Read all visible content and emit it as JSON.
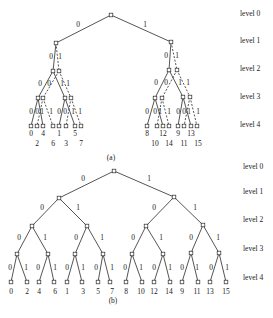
{
  "figure": {
    "level_labels": [
      "level 0",
      "level 1",
      "level 2",
      "level 3",
      "level 4"
    ],
    "node_size": 3.6
  },
  "tree_a": {
    "caption": "(a)",
    "caption_pos": [
      111,
      160
    ],
    "level_label_x": 240,
    "level_label_y": [
      16,
      43,
      71,
      99,
      127
    ],
    "nodes": [
      {
        "id": "r",
        "x": 111,
        "y": 15
      },
      {
        "id": "L",
        "x": 56,
        "y": 43
      },
      {
        "id": "R",
        "x": 171,
        "y": 42
      },
      {
        "id": "L0",
        "x": 53,
        "y": 71
      },
      {
        "id": "L1",
        "x": 59,
        "y": 71
      },
      {
        "id": "R0",
        "x": 169,
        "y": 70
      },
      {
        "id": "R1",
        "x": 177,
        "y": 70
      },
      {
        "id": "a3",
        "x": 38,
        "y": 98
      },
      {
        "id": "b3",
        "x": 43,
        "y": 98
      },
      {
        "id": "c3",
        "x": 65,
        "y": 98
      },
      {
        "id": "d3",
        "x": 71,
        "y": 98
      },
      {
        "id": "e3",
        "x": 155,
        "y": 98
      },
      {
        "id": "f3",
        "x": 162,
        "y": 98
      },
      {
        "id": "g3",
        "x": 183,
        "y": 97
      },
      {
        "id": "h3",
        "x": 190,
        "y": 97
      },
      {
        "id": "n0",
        "x": 31,
        "y": 126
      },
      {
        "id": "n4",
        "x": 37,
        "y": 126
      },
      {
        "id": "n2",
        "x": 43,
        "y": 126
      },
      {
        "id": "n6",
        "x": 53,
        "y": 126
      },
      {
        "id": "n1",
        "x": 59,
        "y": 126
      },
      {
        "id": "n5",
        "x": 66,
        "y": 126
      },
      {
        "id": "n3",
        "x": 75,
        "y": 126
      },
      {
        "id": "n7",
        "x": 81,
        "y": 126
      },
      {
        "id": "n8",
        "x": 147,
        "y": 126
      },
      {
        "id": "n12",
        "x": 157,
        "y": 126
      },
      {
        "id": "n10",
        "x": 163,
        "y": 126
      },
      {
        "id": "n14",
        "x": 169,
        "y": 126
      },
      {
        "id": "n9",
        "x": 178,
        "y": 126
      },
      {
        "id": "n13",
        "x": 184,
        "y": 126
      },
      {
        "id": "n11",
        "x": 191,
        "y": 126
      },
      {
        "id": "n15",
        "x": 197,
        "y": 126
      }
    ],
    "edges": [
      {
        "from": "r",
        "to": "L",
        "style": "solid",
        "label": "0",
        "lx": 78,
        "ly": 27
      },
      {
        "from": "r",
        "to": "R",
        "style": "solid",
        "label": "1",
        "lx": 145,
        "ly": 27
      },
      {
        "from": "L",
        "to": "L0",
        "style": "solid",
        "label": "0",
        "lx": 51,
        "ly": 59
      },
      {
        "from": "L",
        "to": "L1",
        "style": "dashed",
        "label": "1",
        "lx": 60,
        "ly": 59
      },
      {
        "from": "R",
        "to": "R0",
        "style": "solid",
        "label": "0",
        "lx": 166,
        "ly": 58
      },
      {
        "from": "R",
        "to": "R1",
        "style": "dashed",
        "label": "1",
        "lx": 177,
        "ly": 58
      },
      {
        "from": "L0",
        "to": "a3",
        "style": "solid",
        "label": "0",
        "lx": 40,
        "ly": 86
      },
      {
        "from": "L0",
        "to": "c3",
        "style": "solid",
        "label": "1",
        "lx": 62,
        "ly": 86
      },
      {
        "from": "L1",
        "to": "b3",
        "style": "dashed",
        "label": "0",
        "lx": 49,
        "ly": 86
      },
      {
        "from": "L1",
        "to": "d3",
        "style": "dashed",
        "label": "1",
        "lx": 68,
        "ly": 86
      },
      {
        "from": "R0",
        "to": "e3",
        "style": "solid",
        "label": "0",
        "lx": 156,
        "ly": 85
      },
      {
        "from": "R0",
        "to": "g3",
        "style": "solid",
        "label": "1",
        "lx": 180,
        "ly": 85
      },
      {
        "from": "R1",
        "to": "f3",
        "style": "dashed",
        "label": "0",
        "lx": 166,
        "ly": 85
      },
      {
        "from": "R1",
        "to": "h3",
        "style": "dashed",
        "label": "1",
        "lx": 188,
        "ly": 85
      },
      {
        "from": "a3",
        "to": "n0",
        "style": "solid",
        "label": "0",
        "lx": 31,
        "ly": 114
      },
      {
        "from": "a3",
        "to": "n2",
        "style": "solid",
        "label": "1",
        "lx": 42,
        "ly": 114
      },
      {
        "from": "b3",
        "to": "n4",
        "style": "dashed",
        "label": "0",
        "lx": 37,
        "ly": 114
      },
      {
        "from": "b3",
        "to": "n6",
        "style": "dashed",
        "label": "1",
        "lx": 51,
        "ly": 114
      },
      {
        "from": "c3",
        "to": "n1",
        "style": "solid",
        "label": "0",
        "lx": 59,
        "ly": 114
      },
      {
        "from": "c3",
        "to": "n3",
        "style": "solid",
        "label": "1",
        "lx": 73,
        "ly": 114
      },
      {
        "from": "d3",
        "to": "n5",
        "style": "dashed",
        "label": "0",
        "lx": 65,
        "ly": 114
      },
      {
        "from": "d3",
        "to": "n7",
        "style": "dashed",
        "label": "1",
        "lx": 80,
        "ly": 114
      },
      {
        "from": "e3",
        "to": "n8",
        "style": "solid",
        "label": "0",
        "lx": 147,
        "ly": 114
      },
      {
        "from": "e3",
        "to": "n10",
        "style": "solid",
        "label": "1",
        "lx": 160,
        "ly": 114
      },
      {
        "from": "f3",
        "to": "n12",
        "style": "dashed",
        "label": "0",
        "lx": 155,
        "ly": 114
      },
      {
        "from": "f3",
        "to": "n14",
        "style": "dashed",
        "label": "1",
        "lx": 169,
        "ly": 114
      },
      {
        "from": "g3",
        "to": "n9",
        "style": "solid",
        "label": "0",
        "lx": 178,
        "ly": 114
      },
      {
        "from": "g3",
        "to": "n11",
        "style": "solid",
        "label": "1",
        "lx": 189,
        "ly": 114
      },
      {
        "from": "h3",
        "to": "n13",
        "style": "dashed",
        "label": "0",
        "lx": 184,
        "ly": 114
      },
      {
        "from": "h3",
        "to": "n15",
        "style": "dashed",
        "label": "1",
        "lx": 198,
        "ly": 114
      }
    ],
    "leaf_labels": [
      {
        "text": "0",
        "x": 31,
        "y": 136
      },
      {
        "text": "4",
        "x": 43,
        "y": 136
      },
      {
        "text": "1",
        "x": 59,
        "y": 136
      },
      {
        "text": "5",
        "x": 75,
        "y": 136
      },
      {
        "text": "2",
        "x": 37,
        "y": 146
      },
      {
        "text": "6",
        "x": 53,
        "y": 146
      },
      {
        "text": "3",
        "x": 66,
        "y": 146
      },
      {
        "text": "7",
        "x": 81,
        "y": 146
      },
      {
        "text": "8",
        "x": 147,
        "y": 136
      },
      {
        "text": "12",
        "x": 163,
        "y": 136
      },
      {
        "text": "9",
        "x": 178,
        "y": 136
      },
      {
        "text": "13",
        "x": 191,
        "y": 136
      },
      {
        "text": "10",
        "x": 155,
        "y": 146
      },
      {
        "text": "14",
        "x": 169,
        "y": 146
      },
      {
        "text": "11",
        "x": 184,
        "y": 146
      },
      {
        "text": "15",
        "x": 198,
        "y": 146
      }
    ]
  },
  "tree_b": {
    "caption": "(b)",
    "caption_pos": [
      113,
      303
    ],
    "level_label_x": 243,
    "level_label_y": [
      169,
      194,
      222,
      251,
      280
    ],
    "nodes": [
      {
        "id": "r",
        "x": 114,
        "y": 171
      },
      {
        "id": "L",
        "x": 59,
        "y": 198
      },
      {
        "id": "R",
        "x": 174,
        "y": 197
      },
      {
        "id": "LL",
        "x": 32,
        "y": 226
      },
      {
        "id": "LR",
        "x": 87,
        "y": 226
      },
      {
        "id": "RL",
        "x": 146,
        "y": 226
      },
      {
        "id": "RR",
        "x": 203,
        "y": 225
      },
      {
        "id": "a",
        "x": 17,
        "y": 254
      },
      {
        "id": "b",
        "x": 48,
        "y": 254
      },
      {
        "id": "c",
        "x": 75,
        "y": 254
      },
      {
        "id": "d",
        "x": 103,
        "y": 254
      },
      {
        "id": "e",
        "x": 132,
        "y": 254
      },
      {
        "id": "f",
        "x": 163,
        "y": 254
      },
      {
        "id": "g",
        "x": 191,
        "y": 253
      },
      {
        "id": "h",
        "x": 219,
        "y": 253
      },
      {
        "id": "l0",
        "x": 11,
        "y": 282
      },
      {
        "id": "l1",
        "x": 27,
        "y": 282
      },
      {
        "id": "l2",
        "x": 39,
        "y": 282
      },
      {
        "id": "l3",
        "x": 54,
        "y": 282
      },
      {
        "id": "l4",
        "x": 67,
        "y": 282
      },
      {
        "id": "l5",
        "x": 82,
        "y": 282
      },
      {
        "id": "l6",
        "x": 98,
        "y": 282
      },
      {
        "id": "l7",
        "x": 110,
        "y": 282
      },
      {
        "id": "l8",
        "x": 126,
        "y": 282
      },
      {
        "id": "l9",
        "x": 142,
        "y": 282
      },
      {
        "id": "l10",
        "x": 154,
        "y": 282
      },
      {
        "id": "l11",
        "x": 170,
        "y": 282
      },
      {
        "id": "l12",
        "x": 182,
        "y": 282
      },
      {
        "id": "l13",
        "x": 198,
        "y": 282
      },
      {
        "id": "l14",
        "x": 210,
        "y": 282
      },
      {
        "id": "l15",
        "x": 226,
        "y": 282
      }
    ],
    "edges": [
      {
        "from": "r",
        "to": "L",
        "style": "solid",
        "label": "0",
        "lx": 83,
        "ly": 181
      },
      {
        "from": "r",
        "to": "R",
        "style": "solid",
        "label": "1",
        "lx": 149,
        "ly": 181
      },
      {
        "from": "L",
        "to": "LL",
        "style": "solid",
        "label": "0",
        "lx": 42,
        "ly": 210
      },
      {
        "from": "L",
        "to": "LR",
        "style": "solid",
        "label": "1",
        "lx": 78,
        "ly": 210
      },
      {
        "from": "R",
        "to": "RL",
        "style": "solid",
        "label": "0",
        "lx": 154,
        "ly": 210
      },
      {
        "from": "R",
        "to": "RR",
        "style": "solid",
        "label": "1",
        "lx": 195,
        "ly": 210
      },
      {
        "from": "LL",
        "to": "a",
        "style": "solid",
        "label": "0",
        "lx": 19,
        "ly": 240
      },
      {
        "from": "LL",
        "to": "b",
        "style": "solid",
        "label": "1",
        "lx": 45,
        "ly": 240
      },
      {
        "from": "LR",
        "to": "c",
        "style": "solid",
        "label": "0",
        "lx": 76,
        "ly": 240
      },
      {
        "from": "LR",
        "to": "d",
        "style": "solid",
        "label": "1",
        "lx": 102,
        "ly": 240
      },
      {
        "from": "RL",
        "to": "e",
        "style": "solid",
        "label": "0",
        "lx": 133,
        "ly": 240
      },
      {
        "from": "RL",
        "to": "f",
        "style": "solid",
        "label": "1",
        "lx": 161,
        "ly": 240
      },
      {
        "from": "RR",
        "to": "g",
        "style": "solid",
        "label": "0",
        "lx": 191,
        "ly": 240
      },
      {
        "from": "RR",
        "to": "h",
        "style": "solid",
        "label": "1",
        "lx": 218,
        "ly": 240
      },
      {
        "from": "a",
        "to": "l0",
        "style": "solid",
        "label": "0",
        "lx": 10,
        "ly": 270
      },
      {
        "from": "a",
        "to": "l1",
        "style": "solid",
        "label": "1",
        "lx": 26,
        "ly": 270
      },
      {
        "from": "b",
        "to": "l2",
        "style": "solid",
        "label": "0",
        "lx": 38,
        "ly": 270
      },
      {
        "from": "b",
        "to": "l3",
        "style": "solid",
        "label": "1",
        "lx": 55,
        "ly": 270
      },
      {
        "from": "c",
        "to": "l4",
        "style": "solid",
        "label": "0",
        "lx": 67,
        "ly": 270
      },
      {
        "from": "c",
        "to": "l5",
        "style": "solid",
        "label": "1",
        "lx": 83,
        "ly": 270
      },
      {
        "from": "d",
        "to": "l6",
        "style": "solid",
        "label": "0",
        "lx": 96,
        "ly": 270
      },
      {
        "from": "d",
        "to": "l7",
        "style": "solid",
        "label": "1",
        "lx": 112,
        "ly": 270
      },
      {
        "from": "e",
        "to": "l8",
        "style": "solid",
        "label": "0",
        "lx": 125,
        "ly": 270
      },
      {
        "from": "e",
        "to": "l9",
        "style": "solid",
        "label": "1",
        "lx": 141,
        "ly": 270
      },
      {
        "from": "f",
        "to": "l10",
        "style": "solid",
        "label": "0",
        "lx": 154,
        "ly": 270
      },
      {
        "from": "f",
        "to": "l11",
        "style": "solid",
        "label": "1",
        "lx": 170,
        "ly": 270
      },
      {
        "from": "g",
        "to": "l12",
        "style": "solid",
        "label": "0",
        "lx": 182,
        "ly": 270
      },
      {
        "from": "g",
        "to": "l13",
        "style": "solid",
        "label": "1",
        "lx": 197,
        "ly": 270
      },
      {
        "from": "h",
        "to": "l14",
        "style": "solid",
        "label": "0",
        "lx": 211,
        "ly": 270
      },
      {
        "from": "h",
        "to": "l15",
        "style": "solid",
        "label": "1",
        "lx": 227,
        "ly": 270
      }
    ],
    "leaf_labels": [
      {
        "text": "0",
        "x": 11,
        "y": 294
      },
      {
        "text": "2",
        "x": 27,
        "y": 294
      },
      {
        "text": "4",
        "x": 39,
        "y": 294
      },
      {
        "text": "6",
        "x": 55,
        "y": 294
      },
      {
        "text": "1",
        "x": 67,
        "y": 294
      },
      {
        "text": "3",
        "x": 83,
        "y": 294
      },
      {
        "text": "5",
        "x": 98,
        "y": 294
      },
      {
        "text": "7",
        "x": 112,
        "y": 294
      },
      {
        "text": "8",
        "x": 126,
        "y": 294
      },
      {
        "text": "10",
        "x": 141,
        "y": 294
      },
      {
        "text": "12",
        "x": 154,
        "y": 294
      },
      {
        "text": "14",
        "x": 169,
        "y": 294
      },
      {
        "text": "9",
        "x": 182,
        "y": 294
      },
      {
        "text": "11",
        "x": 197,
        "y": 294
      },
      {
        "text": "13",
        "x": 210,
        "y": 294
      },
      {
        "text": "15",
        "x": 226,
        "y": 294
      }
    ]
  }
}
